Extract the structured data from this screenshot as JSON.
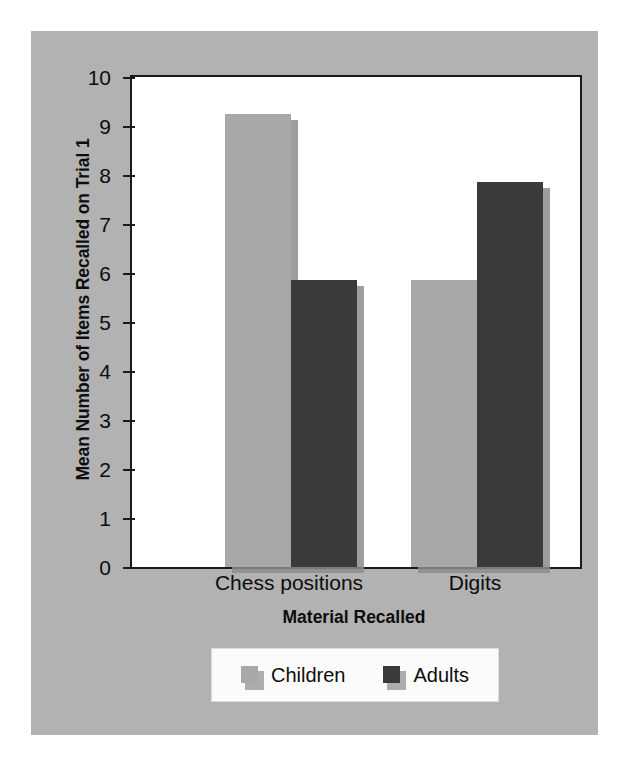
{
  "figure": {
    "panel_background": "#b2b2b2",
    "plot_background": "#ffffff"
  },
  "chart_data": {
    "type": "bar",
    "title": "",
    "xlabel": "Material Recalled",
    "ylabel": "Mean Number of Items Recalled on Trial 1",
    "categories": [
      "Chess positions",
      "Digits"
    ],
    "series": [
      {
        "name": "Children",
        "color": "#a8a8a8",
        "values": [
          9.25,
          5.85
        ]
      },
      {
        "name": "Adults",
        "color": "#3a3a3a",
        "values": [
          5.85,
          7.85
        ]
      }
    ],
    "ylim": [
      0,
      10
    ],
    "ytick_step": 1,
    "yticks": [
      "10",
      "9",
      "8",
      "7",
      "6",
      "5",
      "4",
      "3",
      "2",
      "1",
      "0"
    ],
    "grid": false,
    "legend_position": "bottom",
    "legend_entries": [
      "Children",
      "Adults"
    ]
  },
  "axes": {
    "y_title": "Mean Number of Items Recalled on Trial 1",
    "x_title": "Material Recalled",
    "y_tick_labels": [
      "10",
      "9",
      "8",
      "7",
      "6",
      "5",
      "4",
      "3",
      "2",
      "1",
      "0"
    ],
    "x_tick_labels": [
      "Chess positions",
      "Digits"
    ]
  },
  "legend": {
    "items": [
      {
        "label": "Children",
        "color": "#a8a8a8"
      },
      {
        "label": "Adults",
        "color": "#3a3a3a"
      }
    ]
  }
}
